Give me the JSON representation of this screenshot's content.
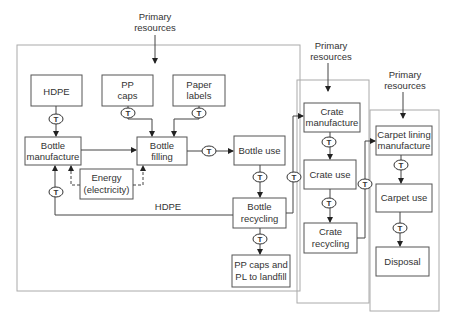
{
  "diagram": {
    "primary_resources": [
      {
        "line1": "Primary",
        "line2": "resources"
      },
      {
        "line1": "Primary",
        "line2": "resources"
      },
      {
        "line1": "Primary",
        "line2": "resources"
      }
    ],
    "nodes": {
      "hdpe": {
        "line1": "HDPE"
      },
      "pp_caps": {
        "line1": "PP",
        "line2": "caps"
      },
      "paper_labels": {
        "line1": "Paper",
        "line2": "labels"
      },
      "bottle_manufacture": {
        "line1": "Bottle",
        "line2": "manufacture"
      },
      "bottle_filling": {
        "line1": "Bottle",
        "line2": "filling"
      },
      "energy": {
        "line1": "Energy",
        "line2": "(electricity)"
      },
      "bottle_use": {
        "line1": "Bottle use"
      },
      "bottle_recycling": {
        "line1": "Bottle",
        "line2": "recycling"
      },
      "landfill": {
        "line1": "PP caps and",
        "line2": "PL to landfill"
      },
      "crate_manufacture": {
        "line1": "Crate",
        "line2": "manufacture"
      },
      "crate_use": {
        "line1": "Crate use"
      },
      "crate_recycling": {
        "line1": "Crate",
        "line2": "recycling"
      },
      "carpet_lining": {
        "line1": "Carpet lining",
        "line2": "manufacture"
      },
      "carpet_use": {
        "line1": "Carpet use"
      },
      "disposal": {
        "line1": "Disposal"
      }
    },
    "edge_labels": {
      "hdpe_return": "HDPE",
      "transport": "T"
    }
  }
}
